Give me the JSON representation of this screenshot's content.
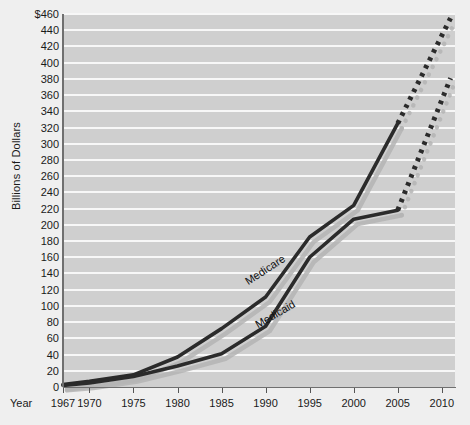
{
  "chart_data": {
    "type": "line",
    "title": "",
    "subtitle": "",
    "xlabel": "Year",
    "ylabel": "Billions of Dollars",
    "xlim": [
      1967,
      2011.5
    ],
    "ylim": [
      0,
      460
    ],
    "grid": true,
    "legend_position": "inline-labels",
    "y_tick_labels": [
      "$460",
      "440",
      "420",
      "400",
      "380",
      "360",
      "340",
      "320",
      "300",
      "280",
      "260",
      "240",
      "220",
      "200",
      "180",
      "160",
      "140",
      "120",
      "100",
      "80",
      "60",
      "40",
      "20",
      "0"
    ],
    "y_ticks": [
      460,
      440,
      420,
      400,
      380,
      360,
      340,
      320,
      300,
      280,
      260,
      240,
      220,
      200,
      180,
      160,
      140,
      120,
      100,
      80,
      60,
      40,
      20,
      0
    ],
    "x_tick_labels": [
      "1967",
      "1970",
      "1975",
      "1980",
      "1985",
      "1990",
      "1995",
      "2000",
      "2005",
      "2010"
    ],
    "x_ticks": [
      1967,
      1970,
      1975,
      1980,
      1985,
      1990,
      1995,
      2000,
      2005,
      2010
    ],
    "series": [
      {
        "name": "Medicare",
        "color": "#2b2b2b",
        "style": "solid",
        "x": [
          1967,
          1970,
          1975,
          1980,
          1985,
          1990,
          1995,
          2000,
          2005
        ],
        "values": [
          3,
          7,
          15,
          37,
          72,
          111,
          185,
          224,
          325
        ]
      },
      {
        "name": "Medicare projected",
        "color": "#2b2b2b",
        "style": "dotted",
        "x": [
          2005,
          2011
        ],
        "values": [
          325,
          455
        ]
      },
      {
        "name": "Medicaid",
        "color": "#2b2b2b",
        "style": "solid",
        "x": [
          1967,
          1970,
          1975,
          1980,
          1985,
          1990,
          1995,
          2000,
          2005
        ],
        "values": [
          2,
          5,
          13,
          26,
          41,
          75,
          160,
          207,
          218
        ]
      },
      {
        "name": "Medicaid projected",
        "color": "#2b2b2b",
        "style": "dotted",
        "x": [
          2005,
          2011
        ],
        "values": [
          218,
          381
        ]
      }
    ],
    "annotations": [
      {
        "name": "Medicare",
        "text": "Medicare"
      },
      {
        "name": "Medicaid",
        "text": "Medicaid"
      }
    ],
    "colors": {
      "page_background": "#efefef",
      "plot_background": "#cfcfcf",
      "gridline": "#f7f7f7",
      "line": "#2b2b2b",
      "shadow": "#b4b4b4",
      "text": "#1a1a1a"
    }
  }
}
